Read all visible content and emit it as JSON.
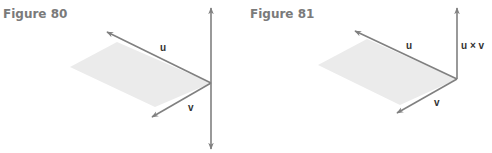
{
  "colors": {
    "arrow": "#808080",
    "plane": "#ebebeb",
    "title": "#7a7a7a",
    "label": "#333333"
  },
  "figures": [
    {
      "title": "Figure 80",
      "title_pos": {
        "x": 3,
        "y": 7
      },
      "plane": [
        [
          117,
          42
        ],
        [
          70,
          67
        ],
        [
          155,
          107
        ],
        [
          211,
          83
        ]
      ],
      "origin": [
        211,
        83
      ],
      "vectors": [
        {
          "name": "u",
          "label": "u",
          "tip": [
            107,
            32
          ],
          "label_pos": [
            160,
            51
          ]
        },
        {
          "name": "v",
          "label": "v",
          "tip": [
            152,
            117
          ],
          "label_pos": [
            188,
            111
          ]
        }
      ],
      "axis": {
        "type": "double-arrow",
        "x": 211,
        "top": 8,
        "bottom": 149,
        "label": ""
      }
    },
    {
      "title": "Figure 81",
      "title_pos": {
        "x": 4,
        "y": 7
      },
      "plane": [
        [
          121,
          39
        ],
        [
          72,
          65
        ],
        [
          154,
          105
        ],
        [
          211,
          79
        ]
      ],
      "origin": [
        211,
        79
      ],
      "vectors": [
        {
          "name": "u",
          "label": "u",
          "tip": [
            109,
            31
          ],
          "label_pos": [
            160,
            49
          ]
        },
        {
          "name": "v",
          "label": "v",
          "tip": [
            151,
            113
          ],
          "label_pos": [
            188,
            106
          ]
        }
      ],
      "axis": {
        "type": "up-arrow",
        "x": 211,
        "top": 8,
        "bottom": 79,
        "label": "u × v",
        "label_pos": [
          215,
          49
        ]
      }
    }
  ]
}
